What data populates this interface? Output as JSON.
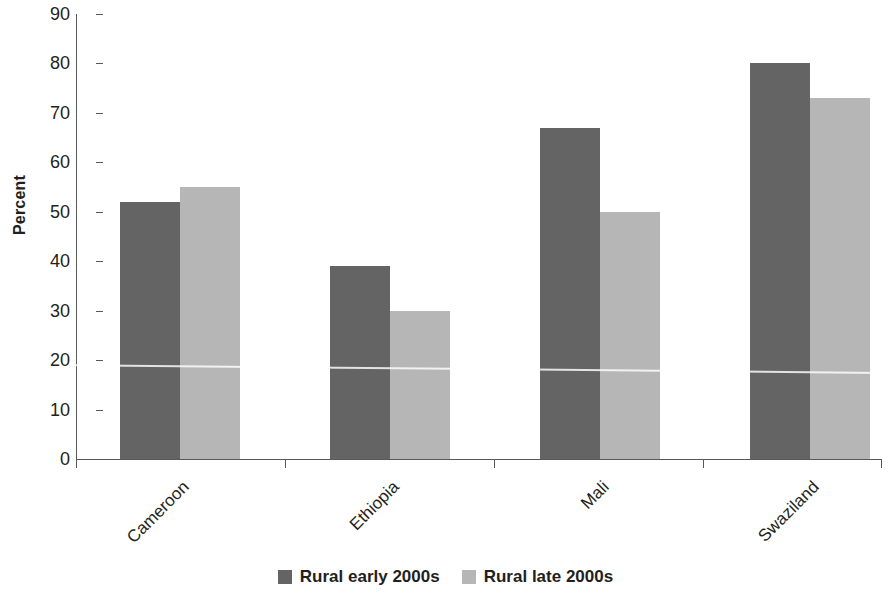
{
  "chart_data": {
    "type": "bar",
    "title": "",
    "subtitle": "",
    "xlabel": "",
    "ylabel": "Percent",
    "ylim": [
      0,
      90
    ],
    "ytick_step": 10,
    "yticks": [
      0,
      10,
      20,
      30,
      40,
      50,
      60,
      70,
      80,
      90
    ],
    "ytick_labels": [
      "0",
      "10",
      "20",
      "30",
      "40",
      "50",
      "60",
      "70",
      "80",
      "90"
    ],
    "grid": false,
    "legend_position": "bottom",
    "categories": [
      "Cameroon",
      "Ethiopia",
      "Mali",
      "Swaziland"
    ],
    "series": [
      {
        "name": "Rural early 2000s",
        "color": "#646464",
        "values": [
          52,
          39,
          67,
          80
        ]
      },
      {
        "name": "Rural late 2000s",
        "color": "#b6b6b6",
        "values": [
          55,
          30,
          50,
          73
        ]
      }
    ]
  },
  "legend": {
    "items": [
      {
        "label": "Rural early 2000s",
        "swatch": "#646464"
      },
      {
        "label": "Rural late 2000s",
        "swatch": "#b6b6b6"
      }
    ]
  },
  "colors": {
    "series_dark": "#646464",
    "series_light": "#b6b6b6",
    "axis": "#58595b",
    "text": "#231f20",
    "background": "#ffffff"
  }
}
